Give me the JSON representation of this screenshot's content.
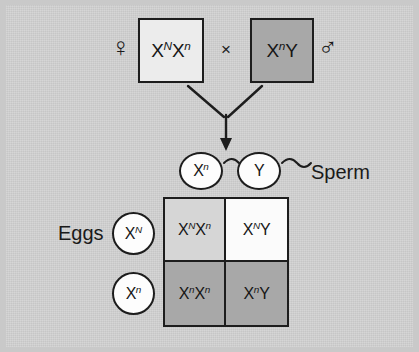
{
  "figure": {
    "background_color": "#c6c6c6",
    "topic": "X-linked recessive inheritance Punnett square"
  },
  "parents": {
    "female": {
      "symbol": "♀",
      "genotype_parts": {
        "allele1": "X",
        "sup1": "N",
        "allele2": "X",
        "sup2": "n"
      },
      "genotype_text": "XNXn",
      "box_fill": "#ececec"
    },
    "cross_sign": "×",
    "male": {
      "symbol": "♂",
      "genotype_parts": {
        "allele1": "X",
        "sup1": "n",
        "allele2": "Y",
        "sup2": ""
      },
      "genotype_text": "XnY",
      "box_fill": "#a8a8a8"
    }
  },
  "gametes": {
    "sperm_label": "Sperm",
    "sperm": [
      {
        "allele": "X",
        "sup": "n"
      },
      {
        "allele": "Y",
        "sup": ""
      }
    ],
    "eggs_label": "Eggs",
    "eggs": [
      {
        "allele": "X",
        "sup": "N"
      },
      {
        "allele": "X",
        "sup": "n"
      }
    ]
  },
  "punnett": {
    "cells": [
      {
        "allele1": "X",
        "sup1": "N",
        "allele2": "X",
        "sup2": "n",
        "fill": "#d6d6d6",
        "shade": "light"
      },
      {
        "allele1": "X",
        "sup1": "N",
        "allele2": "Y",
        "sup2": "",
        "fill": "#fbfbfb",
        "shade": "white"
      },
      {
        "allele1": "X",
        "sup1": "n",
        "allele2": "X",
        "sup2": "n",
        "fill": "#a8a8a8",
        "shade": "dark"
      },
      {
        "allele1": "X",
        "sup1": "n",
        "allele2": "Y",
        "sup2": "",
        "fill": "#a8a8a8",
        "shade": "dark"
      }
    ]
  }
}
